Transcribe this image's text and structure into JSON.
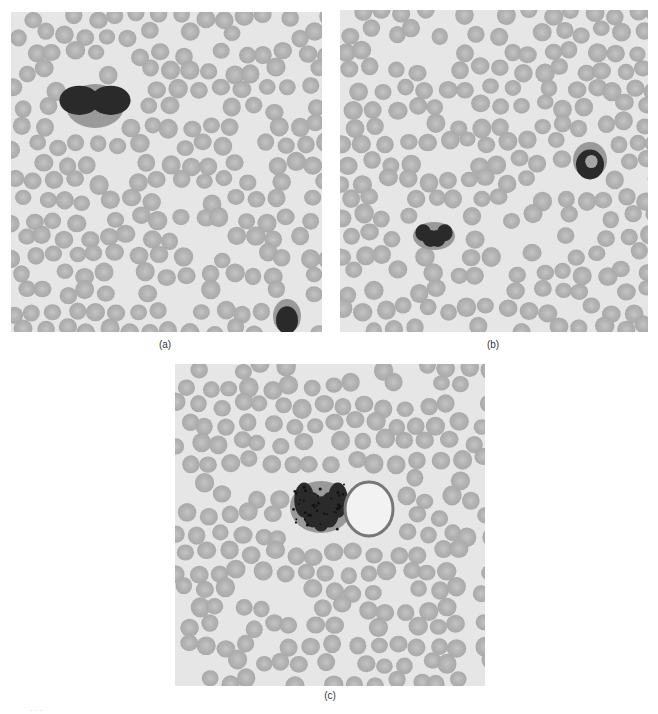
{
  "figure": {
    "panels": [
      {
        "id": "a",
        "label": "(a)",
        "description": "Blood smear micrograph with two dark-stained leukocytes among red blood cells",
        "leukocytes": [
          {
            "x": 58,
            "y": 75,
            "w": 52,
            "h": 38,
            "shape": "bilobed"
          },
          {
            "x": 265,
            "y": 290,
            "w": 22,
            "h": 28,
            "shape": "compact"
          }
        ]
      },
      {
        "id": "b",
        "label": "(b)",
        "description": "Blood smear micrograph with a segmented neutrophil and a band-form leukocyte",
        "leukocytes": [
          {
            "x": 76,
            "y": 215,
            "w": 36,
            "h": 22,
            "shape": "segmented"
          },
          {
            "x": 236,
            "y": 135,
            "w": 28,
            "h": 30,
            "shape": "band"
          }
        ]
      },
      {
        "id": "c",
        "label": "(c)",
        "description": "Blood smear micrograph with a large granular leukocyte and a pale smudged cell",
        "leukocytes": [
          {
            "x": 118,
            "y": 120,
            "w": 56,
            "h": 46,
            "shape": "granular"
          },
          {
            "x": 170,
            "y": 118,
            "w": 48,
            "h": 54,
            "shape": "smudge"
          }
        ]
      }
    ],
    "colors": {
      "background": "#e6e6e6",
      "rbc_fill": "#a9a9a9",
      "rbc_center": "#c4c4c4",
      "nucleus": "#2a2a2a"
    },
    "caption_fragment": "· · ·"
  }
}
